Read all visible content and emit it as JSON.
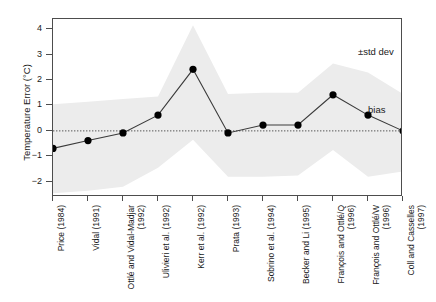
{
  "chart_data": {
    "type": "line",
    "title": "",
    "xlabel": "",
    "ylabel": "Temperature Error (°C)",
    "ylim": [
      -2.6,
      4.4
    ],
    "yticks": [
      4,
      3,
      2,
      1,
      0,
      -1,
      -2
    ],
    "ytick_labels": [
      "4",
      "3",
      "2",
      "1",
      "0",
      "−1",
      "−2"
    ],
    "grid": false,
    "zero_line": true,
    "legend_position": "inside-right",
    "categories": [
      "Price (1984)",
      "Vidal (1991)",
      "Ottlé and Vidal-Madjar (1992)",
      "Ulivieri et al. (1992)",
      "Kerr et al. (1992)",
      "Prata (1993)",
      "Sobrino et al. (1994)",
      "Becker and Li (1995)",
      "François and Ottlé/Q (1996)",
      "François and Ottlé/W (1996)",
      "Coll and Casselles (1997)"
    ],
    "series": [
      {
        "name": "bias",
        "values": [
          -0.69,
          -0.38,
          -0.08,
          0.62,
          2.42,
          -0.08,
          0.23,
          0.23,
          1.42,
          0.62,
          0.0
        ]
      },
      {
        "name": "+std dev",
        "values": [
          1.05,
          1.15,
          1.25,
          1.35,
          4.15,
          1.45,
          1.5,
          1.5,
          2.65,
          2.3,
          1.45
        ]
      },
      {
        "name": "-std dev",
        "values": [
          -2.45,
          -2.35,
          -2.2,
          -1.45,
          -0.35,
          -1.8,
          -1.8,
          -1.75,
          -0.75,
          -1.8,
          -1.6
        ]
      }
    ],
    "annotations": [
      {
        "id": "std-dev",
        "text": "±std dev"
      },
      {
        "id": "bias",
        "text": "bias"
      }
    ],
    "colors": {
      "band": "#ececec",
      "line": "#3a3a3a",
      "marker": "#000000",
      "axis": "#4d4d4d",
      "zero_line": "#555555",
      "text": "#1a1a1a"
    }
  }
}
